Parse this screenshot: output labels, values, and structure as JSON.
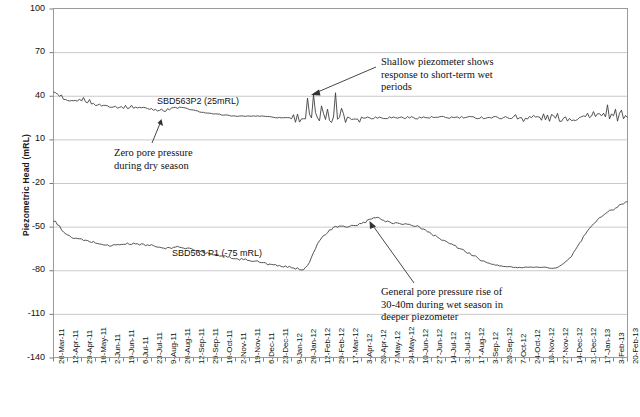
{
  "chart_data": {
    "type": "line",
    "title": "",
    "xlabel": "",
    "ylabel": "Piezometric Head (mRL)",
    "ylim": [
      -140,
      100
    ],
    "yticks": [
      100,
      70,
      40,
      10,
      -20,
      -50,
      -80,
      -110,
      -140
    ],
    "grid": "horizontal",
    "legend_position": "inline-labels",
    "x": [
      "26-Mar-11",
      "12-Apr-11",
      "29-Apr-11",
      "16-May-11",
      "2-Jun-11",
      "19-Jun-11",
      "6-Jul-11",
      "23-Jul-11",
      "9-Aug-11",
      "26-Aug-11",
      "12-Sep-11",
      "29-Sep-11",
      "16-Oct-11",
      "2-Nov-11",
      "19-Nov-11",
      "6-Dec-11",
      "23-Dec-11",
      "9-Jan-12",
      "26-Jan-12",
      "12-Feb-12",
      "29-Feb-12",
      "17-Mar-12",
      "3-Apr-12",
      "20-Apr-12",
      "7-May-12",
      "24-May-12",
      "10-Jun-12",
      "27-Jun-12",
      "14-Jul-12",
      "31-Jul-12",
      "17-Aug-12",
      "3-Sep-12",
      "20-Sep-12",
      "7-Oct-12",
      "24-Oct-12",
      "10-Nov-12",
      "27-Nov-12",
      "14-Dec-12",
      "31-Dec-12",
      "17-Jan-13",
      "3-Feb-13",
      "20-Feb-13"
    ],
    "series": [
      {
        "name": "SBD563P2 (25mRL)",
        "color": "#404040",
        "values": [
          42,
          36,
          37,
          34,
          33,
          32,
          32,
          31,
          30,
          32,
          30,
          28,
          27,
          26,
          26,
          26,
          25,
          25,
          25,
          25,
          25,
          25,
          25,
          25,
          25,
          25,
          25,
          25,
          25,
          25,
          25,
          25,
          25,
          25,
          25,
          25,
          25,
          25,
          25,
          25,
          25,
          25
        ]
      },
      {
        "name": "SBD563 P1 (-75 mRL)",
        "color": "#404040",
        "values": [
          -46,
          -56,
          -59,
          -61,
          -63,
          -62,
          -62,
          -63,
          -65,
          -64,
          -66,
          -68,
          -70,
          -72,
          -73,
          -75,
          -77,
          -78,
          -78,
          -60,
          -51,
          -50,
          -48,
          -44,
          -47,
          -48,
          -50,
          -55,
          -60,
          -65,
          -70,
          -75,
          -77,
          -78,
          -78,
          -78,
          -78,
          -70,
          -55,
          -44,
          -38,
          -33
        ]
      }
    ],
    "annotations": [
      {
        "id": "shallow-response",
        "text": "Shallow piezometer shows\nresponse to short-term wet\nperiods"
      },
      {
        "id": "zero-pore-pressure",
        "text": "Zero pore pressure\nduring dry season"
      },
      {
        "id": "general-rise",
        "text": "General pore pressure rise of\n30-40m during wet season in\ndeeper piezometer"
      }
    ]
  },
  "labels": {
    "shallow_series": "SBD563P2 (25mRL)",
    "deep_series": "SBD563 P1 (-75 mRL)",
    "axis_y": "Piezometric Head (mRL)"
  },
  "colors": {
    "line": "#404040",
    "grid": "#bdbdbd",
    "axis": "#8c8c8c",
    "text": "#111111"
  }
}
